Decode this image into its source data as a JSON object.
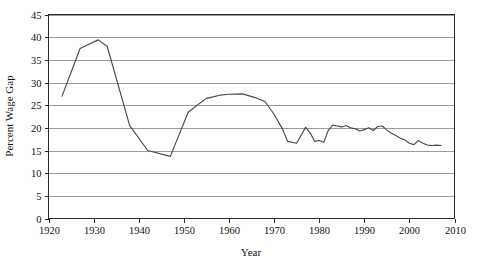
{
  "chart_data": {
    "type": "line",
    "title": "",
    "xlabel": "Year",
    "ylabel": "Percent Wage Gap",
    "xlim": [
      1920,
      2010
    ],
    "ylim": [
      0,
      45
    ],
    "xticks": [
      1920,
      1930,
      1940,
      1950,
      1960,
      1970,
      1980,
      1990,
      2000,
      2010
    ],
    "xtick_labels": [
      "1920",
      "1930",
      "1940",
      "1950",
      "1960",
      "1970",
      "1980",
      "1990",
      "2000",
      "2010"
    ],
    "yticks": [
      0,
      5,
      10,
      15,
      20,
      25,
      30,
      35,
      40,
      45
    ],
    "ytick_labels": [
      "0",
      "5",
      "10",
      "15",
      "20",
      "25",
      "30",
      "35",
      "40",
      "45"
    ],
    "grid": "horizontal",
    "legend": "none",
    "line_color": "#4a4a4a",
    "grid_color": "#9a9a9a",
    "frame_color": "#2b2b2b",
    "series": [
      {
        "name": "Percent Wage Gap",
        "x": [
          1923,
          1927,
          1931,
          1933,
          1938,
          1942,
          1947,
          1951,
          1955,
          1958,
          1960,
          1963,
          1966,
          1968,
          1970,
          1972,
          1973,
          1975,
          1977,
          1978,
          1979,
          1980,
          1981,
          1982,
          1983,
          1984,
          1985,
          1986,
          1987,
          1988,
          1989,
          1990,
          1991,
          1992,
          1993,
          1994,
          1995,
          1996,
          1997,
          1998,
          1999,
          2000,
          2001,
          2002,
          2003,
          2004,
          2005,
          2006,
          2007
        ],
        "values": [
          27.0,
          37.5,
          39.4,
          38.0,
          20.5,
          15.0,
          13.7,
          23.5,
          26.5,
          27.2,
          27.4,
          27.5,
          26.6,
          25.8,
          23.0,
          19.5,
          17.0,
          16.6,
          20.1,
          18.9,
          17.0,
          17.2,
          16.8,
          19.4,
          20.6,
          20.4,
          20.2,
          20.5,
          20.0,
          19.8,
          19.3,
          19.6,
          20.0,
          19.4,
          20.3,
          20.4,
          19.5,
          18.8,
          18.3,
          17.7,
          17.3,
          16.6,
          16.3,
          17.2,
          16.6,
          16.2,
          16.1,
          16.2,
          16.1
        ]
      }
    ]
  },
  "axis": {
    "x_title": "Year",
    "y_title": "Percent Wage Gap"
  }
}
